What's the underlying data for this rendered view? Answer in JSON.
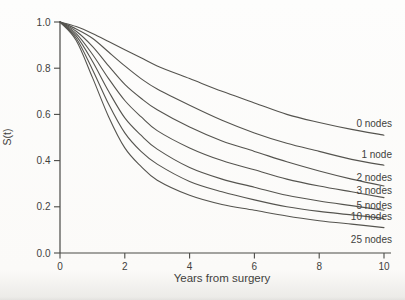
{
  "figure": {
    "background": "#fbfaf8",
    "curve_color": "#55544f",
    "axis_color": "#4a4a46",
    "text_color": "#3f3f3d",
    "curve_stroke_width": 1.1
  },
  "chart_data": {
    "type": "line",
    "title": "",
    "xlabel": "Years from surgery",
    "ylabel": "S(t)",
    "xlim": [
      0,
      10
    ],
    "ylim": [
      0.0,
      1.0
    ],
    "grid": false,
    "legend_position": "inline-right-of-curves",
    "x_ticks": [
      0,
      2,
      4,
      6,
      8,
      10
    ],
    "x_tick_labels": [
      "0",
      "2",
      "4",
      "6",
      "8",
      "10"
    ],
    "y_ticks": [
      0.0,
      0.2,
      0.4,
      0.6,
      0.8,
      1.0
    ],
    "y_tick_labels": [
      "0.0",
      "0.2",
      "0.4",
      "0.6",
      "0.8",
      "1.0"
    ],
    "x": [
      0,
      0.5,
      1,
      1.5,
      2,
      2.5,
      3,
      4,
      5,
      6,
      7,
      8,
      9,
      10
    ],
    "series": [
      {
        "name": "0 nodes",
        "label_dy": -12,
        "values": [
          1.0,
          0.98,
          0.95,
          0.915,
          0.88,
          0.845,
          0.81,
          0.755,
          0.7,
          0.65,
          0.6,
          0.565,
          0.535,
          0.51
        ]
      },
      {
        "name": "1 node",
        "label_dy": -11,
        "values": [
          1.0,
          0.97,
          0.93,
          0.87,
          0.81,
          0.755,
          0.71,
          0.64,
          0.575,
          0.52,
          0.475,
          0.44,
          0.405,
          0.38
        ]
      },
      {
        "name": "2 nodes",
        "label_dy": -9,
        "values": [
          1.0,
          0.96,
          0.895,
          0.81,
          0.73,
          0.67,
          0.62,
          0.545,
          0.485,
          0.44,
          0.395,
          0.355,
          0.32,
          0.29
        ]
      },
      {
        "name": "3 nodes",
        "label_dy": -7,
        "values": [
          1.0,
          0.95,
          0.86,
          0.755,
          0.66,
          0.59,
          0.53,
          0.455,
          0.4,
          0.36,
          0.32,
          0.29,
          0.265,
          0.24
        ]
      },
      {
        "name": "5 nodes",
        "label_dy": -5,
        "values": [
          1.0,
          0.94,
          0.83,
          0.7,
          0.585,
          0.51,
          0.45,
          0.37,
          0.32,
          0.285,
          0.25,
          0.225,
          0.205,
          0.185
        ]
      },
      {
        "name": "10 nodes",
        "label_dy": -2,
        "values": [
          1.0,
          0.93,
          0.795,
          0.645,
          0.52,
          0.44,
          0.385,
          0.31,
          0.265,
          0.23,
          0.2,
          0.18,
          0.165,
          0.15
        ]
      },
      {
        "name": "25 nodes",
        "label_dy": 12,
        "values": [
          1.0,
          0.92,
          0.76,
          0.59,
          0.455,
          0.375,
          0.315,
          0.25,
          0.21,
          0.185,
          0.16,
          0.14,
          0.125,
          0.11
        ]
      }
    ]
  }
}
